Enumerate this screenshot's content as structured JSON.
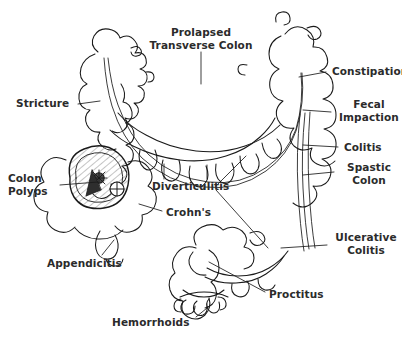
{
  "diagram": {
    "background_color": "#ffffff",
    "line_color": "#1a1a1a",
    "label_color": "#2b2b2b",
    "shading_color": "#8a8a8a"
  },
  "labels": [
    {
      "id": "prolapsed-transverse-colon",
      "text": "Prolapsed\nTransverse Colon",
      "align": "center",
      "x": 143,
      "y": 26,
      "width": 116
    },
    {
      "id": "constipation",
      "text": "Constipation",
      "align": "left",
      "x": 332,
      "y": 65,
      "width": 70
    },
    {
      "id": "fecal-impaction",
      "text": "Fecal\nImpaction",
      "align": "center",
      "x": 337,
      "y": 98,
      "width": 64
    },
    {
      "id": "colitis",
      "text": "Colitis",
      "align": "left",
      "x": 344,
      "y": 141,
      "width": 50
    },
    {
      "id": "spastic-colon",
      "text": "Spastic\nColon",
      "align": "center",
      "x": 340,
      "y": 161,
      "width": 58
    },
    {
      "id": "ulcerative-colitis",
      "text": "Ulcerative\nColitis",
      "align": "center",
      "x": 333,
      "y": 231,
      "width": 66
    },
    {
      "id": "stricture",
      "text": "Stricture",
      "align": "left",
      "x": 16,
      "y": 97,
      "width": 58
    },
    {
      "id": "colon-polyps",
      "text": "Colon\nPolyps",
      "align": "left",
      "x": 8,
      "y": 172,
      "width": 48
    },
    {
      "id": "diverticulitis",
      "text": "Diverticulitis",
      "align": "left",
      "x": 152,
      "y": 180,
      "width": 80
    },
    {
      "id": "crohns",
      "text": "Crohn's",
      "align": "left",
      "x": 166,
      "y": 206,
      "width": 54
    },
    {
      "id": "appendicitis",
      "text": "Appendicitis",
      "align": "left",
      "x": 47,
      "y": 257,
      "width": 78
    },
    {
      "id": "proctitus",
      "text": "Proctitus",
      "align": "left",
      "x": 269,
      "y": 288,
      "width": 58
    },
    {
      "id": "hemorrhoids",
      "text": "Hemorrhoids",
      "align": "left",
      "x": 112,
      "y": 316,
      "width": 82
    }
  ]
}
